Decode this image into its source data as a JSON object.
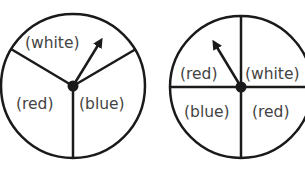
{
  "spinners": [
    {
      "id": "spinner-1",
      "sections": 3,
      "labels": {
        "top": "(white)",
        "left": "(red)",
        "right": "(blue)"
      },
      "arrow_direction": "up-right"
    },
    {
      "id": "spinner-2",
      "sections": 4,
      "labels": {
        "top_left": "(red)",
        "top_right": "(white)",
        "bottom_left": "(blue)",
        "bottom_right": "(red)"
      },
      "arrow_direction": "up-left"
    }
  ],
  "colors": {
    "stroke": "#1a1a1a",
    "text": "#444444",
    "background": "#ffffff"
  }
}
